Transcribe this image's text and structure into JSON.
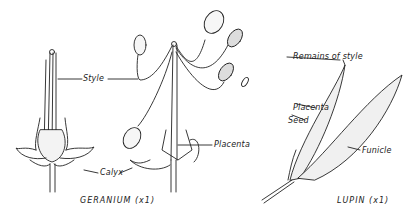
{
  "figure": {
    "geranium": {
      "caption": "GERANIUM (x1)",
      "labels": {
        "style": "Style",
        "calyx": "Calyx",
        "placenta": "Placenta"
      }
    },
    "lupin": {
      "caption": "LUPIN (x1)",
      "labels": {
        "remains_of_style": "Remains of style",
        "placenta": "Placenta",
        "seed": "Seed",
        "funicle": "Funicle"
      }
    }
  }
}
